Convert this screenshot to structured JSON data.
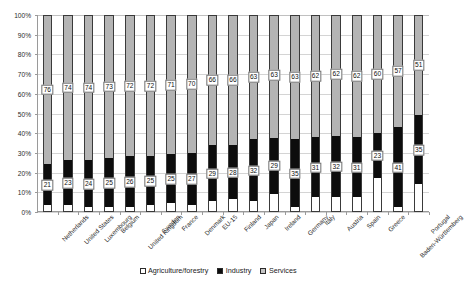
{
  "chart_data": {
    "type": "bar",
    "subtype": "stacked-100-percent",
    "title": "",
    "xlabel": "",
    "ylabel": "",
    "ylim": [
      0,
      100
    ],
    "ytick_labels": [
      "100%",
      "90%",
      "80%",
      "70%",
      "60%",
      "50%",
      "40%",
      "30%",
      "20%",
      "10%",
      "0%"
    ],
    "ytick_values": [
      100,
      90,
      80,
      70,
      60,
      50,
      40,
      30,
      20,
      10,
      0
    ],
    "grid": true,
    "legend_position": "bottom",
    "stack_order_bottom_to_top": [
      "Agriculture/forestry",
      "Industry",
      "Services"
    ],
    "categories": [
      "Netherlands",
      "United States",
      "Luxembourg",
      "Belgium",
      "United Kingdom",
      "Sweden",
      "France",
      "Denmark",
      "EU-15",
      "Finland",
      "Japan",
      "Ireland",
      "Germany",
      "Italy",
      "Austria",
      "Spain",
      "Greece",
      "Baden-Württemberg",
      "Portugal"
    ],
    "series": [
      {
        "name": "Agriculture/forestry",
        "color": "#ffffff",
        "values": [
          3,
          3,
          2,
          2,
          2,
          3,
          4,
          3,
          5,
          6,
          5,
          9,
          2,
          7,
          7,
          7,
          17,
          2,
          14
        ],
        "labels_shown": false
      },
      {
        "name": "Industry",
        "color": "#0d0d0d",
        "values": [
          21,
          23,
          24,
          25,
          26,
          25,
          25,
          27,
          29,
          28,
          32,
          29,
          35,
          31,
          32,
          31,
          23,
          41,
          35
        ],
        "labels_shown": true
      },
      {
        "name": "Services",
        "color": "#b4b4b4",
        "values": [
          76,
          74,
          74,
          73,
          72,
          72,
          71,
          70,
          66,
          66,
          63,
          63,
          63,
          62,
          62,
          62,
          60,
          57,
          51
        ],
        "labels_shown": true
      }
    ]
  },
  "legend": {
    "items": [
      {
        "label": "Agriculture/forestry",
        "swatch": "agri"
      },
      {
        "label": "Industry",
        "swatch": "industry"
      },
      {
        "label": "Services",
        "swatch": "services"
      }
    ]
  },
  "colors": {
    "services": "#b4b4b4",
    "industry": "#0d0d0d",
    "agriculture": "#ffffff",
    "grid": "#d4d4d4",
    "axis": "#9a9a9a",
    "text": "#2b2b2b"
  }
}
